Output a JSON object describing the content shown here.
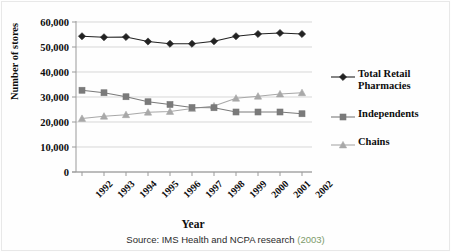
{
  "chart_data": {
    "type": "line",
    "title": "",
    "xlabel": "Year",
    "ylabel": "Number of stores",
    "categories": [
      "1992",
      "1993",
      "1994",
      "1995",
      "1996",
      "1997",
      "1998",
      "1999",
      "2000",
      "2001",
      "2002"
    ],
    "ylim": [
      0,
      60000
    ],
    "ytick_values": [
      0,
      10000,
      20000,
      30000,
      40000,
      50000,
      60000
    ],
    "ytick_labels": [
      "0",
      "10,000",
      "20,000",
      "30,000",
      "40,000",
      "50,000",
      "60,000"
    ],
    "grid": "horizontal",
    "legend_position": "right",
    "series": [
      {
        "name": "Total Retail Pharmacies",
        "marker": "diamond",
        "color": "#222222",
        "values": [
          54300,
          53900,
          54000,
          52200,
          51300,
          51300,
          52300,
          54300,
          55200,
          55600,
          55200
        ]
      },
      {
        "name": "Independents",
        "marker": "square",
        "color": "#7a7a7a",
        "values": [
          32700,
          31700,
          30100,
          28100,
          27000,
          25800,
          25700,
          24000,
          24000,
          24000,
          23300
        ]
      },
      {
        "name": "Chains",
        "marker": "triangle",
        "color": "#a8a8a8",
        "values": [
          21400,
          22300,
          22900,
          23900,
          24200,
          25400,
          26400,
          29500,
          30300,
          31200,
          31700
        ]
      }
    ]
  },
  "legend": {
    "items": [
      {
        "label": "Total Retail Pharmacies",
        "marker": "diamond",
        "color": "#222222"
      },
      {
        "label": "Independents",
        "marker": "square",
        "color": "#7a7a7a"
      },
      {
        "label": "Chains",
        "marker": "triangle",
        "color": "#a8a8a8"
      }
    ]
  },
  "source": {
    "prefix": "Source: IMS Health and NCPA research ",
    "year": "(2003)"
  }
}
